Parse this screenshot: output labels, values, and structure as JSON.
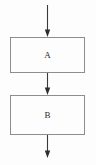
{
  "diagram": {
    "type": "flowchart",
    "orientation": "vertical",
    "background_color": "#fdfdfd",
    "canvas": {
      "width": 96,
      "height": 165
    },
    "node_style": {
      "shape": "rectangle",
      "fill_color": "#fdfdfd",
      "border_color": "#8d8d8d",
      "border_width": 1
    },
    "edge_style": {
      "line_color": "#3a3a3a",
      "line_width": 1.1,
      "arrowhead": "solid-triangle",
      "arrowhead_color": "#2e2e2e"
    },
    "nodes": [
      {
        "id": "node-a",
        "label": "A",
        "x": 10,
        "y": 37,
        "width": 75,
        "height": 36,
        "label_x": 47.5,
        "label_y": 55
      },
      {
        "id": "node-b",
        "label": "B",
        "x": 10,
        "y": 95,
        "width": 75,
        "height": 40,
        "label_x": 47.5,
        "label_y": 115
      }
    ],
    "edges": [
      {
        "id": "edge-entry",
        "from": "start",
        "to": "node-a",
        "label": "",
        "x": 47.5,
        "y_start": 5,
        "y_end": 37
      },
      {
        "id": "edge-a-to-b",
        "from": "node-a",
        "to": "node-b",
        "label": "",
        "x": 47.5,
        "y_start": 73,
        "y_end": 95
      },
      {
        "id": "edge-exit",
        "from": "node-b",
        "to": "end",
        "label": "",
        "x": 47.5,
        "y_start": 135,
        "y_end": 158
      }
    ]
  }
}
